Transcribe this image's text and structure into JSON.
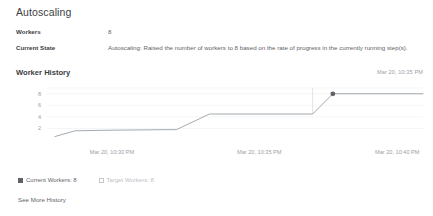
{
  "section": {
    "title": "Autoscaling",
    "properties": [
      {
        "label": "Workers",
        "value": "8"
      },
      {
        "label": "Current State",
        "value": "Autoscaling: Raised the number of workers to 8 based on the rate of progress in the currently running step(s)."
      }
    ]
  },
  "worker_history": {
    "title": "Worker History",
    "timestamp": "Mar 20, 10:35 PM",
    "more_link": "See More History",
    "legend": [
      {
        "label": "Current Workers: 8",
        "active": true,
        "color": "#5f6368"
      },
      {
        "label": "Target Workers: 8",
        "active": false,
        "color": "#bdc1c6"
      }
    ]
  },
  "chart_data": {
    "type": "line",
    "title": "Worker History",
    "xlabel": "",
    "ylabel": "",
    "grid": true,
    "legend_position": "bottom-left",
    "ylim": [
      0,
      9
    ],
    "yticks": [
      2,
      4,
      6,
      8
    ],
    "ytick_labels": [
      "2",
      "4",
      "6",
      "8"
    ],
    "xtick_labels": [
      "Mar 20, 10:30 PM",
      "Mar 20, 10:35 PM",
      "Mar 20, 10:40 PM"
    ],
    "xtick_positions": [
      0.155,
      0.555,
      0.93
    ],
    "series": [
      {
        "name": "Current Workers",
        "color": "#9aa0a6",
        "x": [
          0.0,
          0.055,
          0.155,
          0.33,
          0.42,
          0.7,
          0.755,
          1.0
        ],
        "values": [
          0.6,
          1.6,
          1.7,
          1.8,
          4.5,
          4.5,
          8.0,
          8.0
        ]
      }
    ],
    "markers": [
      {
        "x": 0.755,
        "y": 8.0,
        "label": "Current Workers: 8",
        "color": "#5f6368"
      }
    ],
    "crosshair_x": 0.7
  }
}
